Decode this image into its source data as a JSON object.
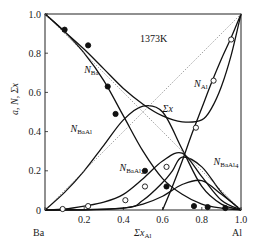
{
  "chart_data": {
    "type": "line",
    "title": "",
    "annotation": "1373K",
    "xlabel": "Σx_Al",
    "ylabel": "a, N, Σx",
    "x_left_label": "Ba",
    "x_right_label": "Al",
    "xlim": [
      0,
      1
    ],
    "ylim": [
      0,
      1
    ],
    "xticks": [
      "0",
      "0.2",
      "0.4",
      "0.6",
      "0.8",
      "1.0"
    ],
    "yticks": [
      "0",
      "0.2",
      "0.4",
      "0.6",
      "0.8",
      "1.0"
    ],
    "grid": false,
    "series": [
      {
        "name": "N_Ba",
        "style": "solid",
        "x": [
          0,
          0.1,
          0.2,
          0.3,
          0.4,
          0.5,
          0.6,
          0.7,
          0.8,
          0.9,
          1.0
        ],
        "y": [
          1.0,
          0.91,
          0.8,
          0.66,
          0.48,
          0.3,
          0.16,
          0.08,
          0.03,
          0.01,
          0
        ]
      },
      {
        "name": "N_Al",
        "style": "solid",
        "x": [
          0.6,
          0.65,
          0.7,
          0.75,
          0.8,
          0.85,
          0.9,
          0.95,
          1.0
        ],
        "y": [
          0.0,
          0.12,
          0.25,
          0.39,
          0.52,
          0.65,
          0.77,
          0.88,
          1.0
        ]
      },
      {
        "name": "N_BaAl",
        "style": "solid",
        "x": [
          0,
          0.1,
          0.2,
          0.3,
          0.4,
          0.5,
          0.6,
          0.7,
          0.8,
          0.9,
          1.0
        ],
        "y": [
          0,
          0.09,
          0.2,
          0.33,
          0.46,
          0.53,
          0.5,
          0.31,
          0.12,
          0.03,
          0
        ]
      },
      {
        "name": "Σx",
        "style": "solid",
        "x": [
          0,
          0.1,
          0.2,
          0.3,
          0.4,
          0.5,
          0.6,
          0.7,
          0.8,
          0.85,
          0.9,
          0.95,
          1.0
        ],
        "y": [
          1.0,
          0.91,
          0.82,
          0.72,
          0.62,
          0.54,
          0.48,
          0.45,
          0.46,
          0.52,
          0.63,
          0.79,
          1.0
        ]
      },
      {
        "name": "N_BaAl2",
        "style": "solid",
        "x": [
          0,
          0.1,
          0.2,
          0.3,
          0.4,
          0.5,
          0.6,
          0.7,
          0.8,
          0.9,
          1.0
        ],
        "y": [
          0,
          0.005,
          0.02,
          0.04,
          0.08,
          0.16,
          0.25,
          0.29,
          0.17,
          0.05,
          0
        ]
      },
      {
        "name": "N_BaAl4",
        "style": "solid",
        "x": [
          0,
          0.2,
          0.4,
          0.5,
          0.6,
          0.7,
          0.8,
          0.9,
          1.0
        ],
        "y": [
          0,
          0.0,
          0.01,
          0.03,
          0.07,
          0.13,
          0.15,
          0.08,
          0
        ]
      },
      {
        "name": "N_BaAl4 (2)",
        "style": "solid",
        "x": [
          0,
          0.4,
          0.5,
          0.6,
          0.65,
          0.7,
          0.8,
          0.9,
          1.0
        ],
        "y": [
          0,
          0.01,
          0.05,
          0.14,
          0.2,
          0.27,
          0.22,
          0.09,
          0
        ]
      },
      {
        "name": "ideal (dotted)",
        "style": "dotted",
        "x": [
          0,
          1
        ],
        "y": [
          1,
          0
        ]
      },
      {
        "name": "ideal Al (dotted)",
        "style": "dotted",
        "x": [
          0,
          1
        ],
        "y": [
          0,
          1
        ]
      }
    ],
    "points": [
      {
        "series": "N_Ba",
        "marker": "filled",
        "x": [
          0.1,
          0.22,
          0.32,
          0.36,
          0.51,
          0.62,
          0.76,
          0.83,
          0.92
        ],
        "y": [
          0.92,
          0.84,
          0.63,
          0.49,
          0.2,
          0.12,
          0.02,
          0.015,
          0.01
        ]
      },
      {
        "series": "N_Al",
        "marker": "open",
        "x": [
          0.77,
          0.86,
          0.95
        ],
        "y": [
          0.42,
          0.66,
          0.87
        ]
      },
      {
        "series": "N_BaAl2",
        "marker": "open",
        "x": [
          0.09,
          0.22,
          0.41,
          0.51,
          0.62
        ],
        "y": [
          0.005,
          0.02,
          0.05,
          0.12,
          0.22
        ]
      }
    ],
    "labels": [
      {
        "text": "N",
        "sub": "Ba",
        "x": 0.2,
        "y": 0.7
      },
      {
        "text": "N",
        "sub": "BaAl",
        "x": 0.13,
        "y": 0.4
      },
      {
        "text": "N",
        "sub": "BaAl2",
        "x": 0.38,
        "y": 0.2
      },
      {
        "text": "N",
        "sub": "BaAl4",
        "x": 0.86,
        "y": 0.23
      },
      {
        "text": "N",
        "sub": "Al",
        "x": 0.76,
        "y": 0.63
      },
      {
        "text": "Σx",
        "sub": "",
        "x": 0.6,
        "y": 0.5
      }
    ]
  }
}
